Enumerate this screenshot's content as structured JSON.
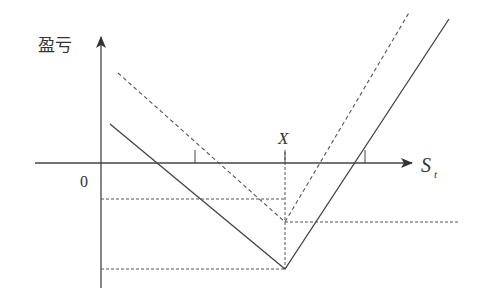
{
  "diagram": {
    "y_axis_label": "盈亏",
    "x_axis_label_main": "S",
    "x_axis_label_sub": "t",
    "origin_label": "0",
    "strike_label": "X",
    "colors": {
      "line": "#444444",
      "dashed": "#555555",
      "text": "#333333",
      "background": "#ffffff"
    },
    "elements": {
      "axes": {
        "x_axis_y": 163,
        "y_axis_x": 101
      },
      "solid_payoff": {
        "start": [
          110,
          124
        ],
        "vertex": [
          285,
          269
        ],
        "end": [
          449,
          19
        ],
        "style": "solid"
      },
      "dashed_payoff": {
        "start": [
          118,
          73
        ],
        "vertex": [
          285,
          222
        ],
        "end": [
          410,
          11
        ],
        "style": "dashed"
      },
      "reference_lines": [
        {
          "from": [
            101,
            199
          ],
          "to": [
            285,
            199
          ],
          "style": "dashed"
        },
        {
          "from": [
            285,
            222
          ],
          "to": [
            458,
            222
          ],
          "style": "dashed"
        },
        {
          "from": [
            101,
            269
          ],
          "to": [
            285,
            269
          ],
          "style": "dashed"
        },
        {
          "from": [
            285,
            163
          ],
          "to": [
            285,
            269
          ],
          "style": "dashed"
        }
      ],
      "breakeven_ticks": [
        195,
        365
      ]
    }
  }
}
